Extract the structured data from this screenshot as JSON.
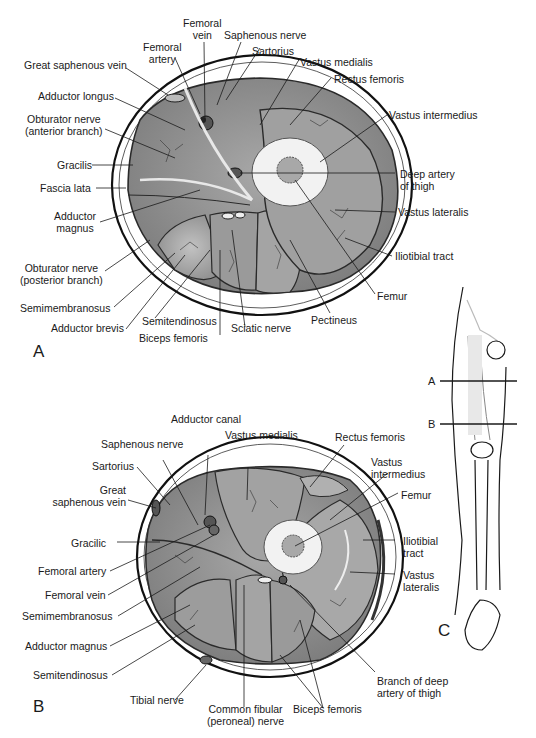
{
  "panels": {
    "a": {
      "letter": "A",
      "labels": {
        "femoral_vein_1": "Femoral",
        "femoral_vein_2": "vein",
        "saphenous_nerve": "Saphenous nerve",
        "femoral_artery_1": "Femoral",
        "femoral_artery_2": "artery",
        "sartorius": "Sartorius",
        "great_saphenous_vein": "Great saphenous vein",
        "vastus_medialis": "Vastus medialis",
        "rectus_femoris": "Rectus femoris",
        "adductor_longus": "Adductor longus",
        "obturator_anterior_1": "Obturator nerve",
        "obturator_anterior_2": "(anterior branch)",
        "vastus_intermedius": "Vastus intermedius",
        "gracilis": "Gracilis",
        "deep_artery_1": "Deep artery",
        "deep_artery_2": "of thigh",
        "fascia_lata": "Fascia lata",
        "vastus_lateralis": "Vastus lateralis",
        "adductor_magnus_1": "Adductor",
        "adductor_magnus_2": "magnus",
        "iliotibial_tract": "Iliotibial tract",
        "obturator_posterior_1": "Obturator nerve",
        "obturator_posterior_2": "(posterior branch)",
        "femur": "Femur",
        "semimembranosus": "Semimembranosus",
        "pectineus": "Pectineus",
        "adductor_brevis": "Adductor brevis",
        "semitendinosus": "Semitendinosus",
        "sciatic_nerve": "Sciatic nerve",
        "biceps_femoris": "Biceps femoris"
      }
    },
    "b": {
      "letter": "B",
      "labels": {
        "adductor_canal": "Adductor canal",
        "saphenous_nerve": "Saphenous nerve",
        "vastus_medialis": "Vastus medialis",
        "rectus_femoris": "Rectus femoris",
        "sartorius": "Sartorius",
        "vastus_intermedius_1": "Vastus",
        "vastus_intermedius_2": "intermedius",
        "great_saphenous_1": "Great",
        "great_saphenous_2": "saphenous vein",
        "femur": "Femur",
        "gracilic": "Gracilic",
        "iliotibial_1": "Iliotibial",
        "iliotibial_2": "tract",
        "femoral_artery": "Femoral artery",
        "vastus_lateralis_1": "Vastus",
        "vastus_lateralis_2": "lateralis",
        "femoral_vein": "Femoral vein",
        "semimembranosus": "Semimembranosus",
        "adductor_magnus": "Adductor magnus",
        "semitendinosus": "Semitendinosus",
        "branch_deep_1": "Branch of deep",
        "branch_deep_2": "artery of thigh",
        "tibial_nerve": "Tibial nerve",
        "common_fibular_1": "Common fibular",
        "common_fibular_2": "(peroneal) nerve",
        "biceps_femoris": "Biceps femoris"
      }
    },
    "c": {
      "letter": "C",
      "level_a": "A",
      "level_b": "B"
    }
  },
  "colors": {
    "muscle": "#8f8f8f",
    "muscle_light": "#b4b4b4",
    "fascia": "#3a3a3a",
    "bone": "#f0f0f0",
    "line": "#1a1a1a"
  }
}
